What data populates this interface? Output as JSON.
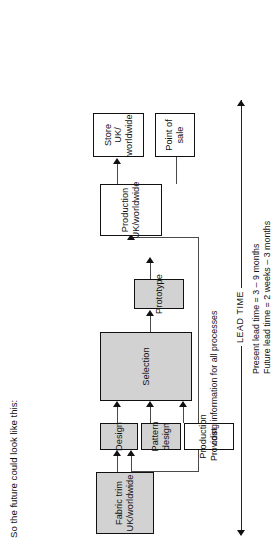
{
  "title": "So the future could look like this:",
  "nodes": {
    "fabric_trim": "Fabric trim\nUK/worldwide",
    "design": "Design",
    "pattern_design": "Pattern\ndesign",
    "production_cost": "Production\ncost",
    "selection": "Selection",
    "prototype": "Prototype",
    "production": "Production\nUK/worldwide",
    "store": "Store\nUK/\nworldwide",
    "point_of_sale": "Point of\nsale"
  },
  "annotations": {
    "providing_info": "Providing information for all processes",
    "lead_time_label": "LEAD TIME",
    "present_lead_time": "Present lead time   =   3  –  9 months",
    "future_lead_time": "Future lead time    =   2 weeks – 3 months"
  },
  "colors": {
    "shade_fill": "#d2d2d2",
    "stroke": "#111111",
    "connector": "#4a4a4a",
    "background": "#ffffff"
  }
}
